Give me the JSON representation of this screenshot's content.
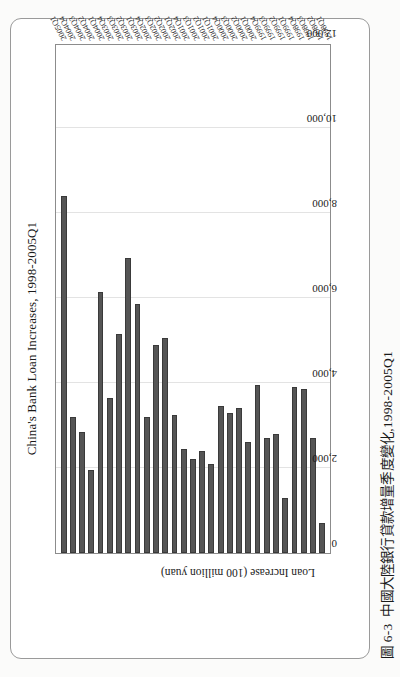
{
  "page": {
    "caption_number": "圖 6-3",
    "caption_text": "中國大陸銀行貸款增量季度變化,1998-2005Q1"
  },
  "chart_data": {
    "type": "bar",
    "orientation": "vertical-printed-sideways",
    "title": "China's Bank Loan Increases, 1998-2005Q1",
    "xlabel": "Quarter",
    "ylabel": "Loan Increase (100 million yuan)",
    "ylim": [
      0,
      12000
    ],
    "yticks": [
      "0",
      "2,000",
      "4,000",
      "6,000",
      "8,000",
      "10,000",
      "12,000"
    ],
    "ytick_values": [
      0,
      2000,
      4000,
      6000,
      8000,
      10000,
      12000
    ],
    "grid": true,
    "legend": "none",
    "bar_color": "#555555",
    "categories": [
      "1998Q1",
      "1998Q2",
      "1998Q3",
      "1998Q4",
      "1999Q1",
      "1999Q2",
      "1999Q3",
      "1999Q4",
      "2000Q1",
      "2000Q2",
      "2000Q3",
      "2000Q4",
      "2001Q1",
      "2001Q2",
      "2001Q3",
      "2001Q4",
      "2002Q1",
      "2002Q2",
      "2002Q3",
      "2002Q4",
      "2003Q1",
      "2003Q2",
      "2003Q3",
      "2003Q4",
      "2004Q1",
      "2004Q2",
      "2004Q3",
      "2004Q4",
      "2005Q1"
    ],
    "values": [
      700,
      2700,
      3850,
      3900,
      1300,
      2800,
      2700,
      3950,
      2600,
      3400,
      3300,
      3450,
      2100,
      2400,
      2200,
      2450,
      3250,
      5050,
      4900,
      3200,
      5850,
      6950,
      5150,
      3650,
      6150,
      1950,
      2850,
      3200,
      8400
    ]
  }
}
